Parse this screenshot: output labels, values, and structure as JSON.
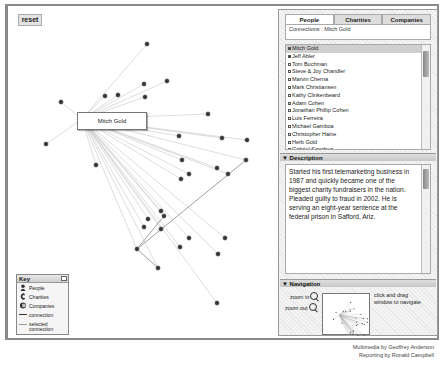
{
  "canvas": {
    "reset_label": "reset",
    "selected_node_label": "Mitch Gold",
    "center": [
      74,
      113
    ],
    "nodes": [
      [
        139,
        38
      ],
      [
        159,
        75
      ],
      [
        136,
        78
      ],
      [
        110,
        89
      ],
      [
        53,
        96
      ],
      [
        97,
        90
      ],
      [
        137,
        91
      ],
      [
        38,
        138
      ],
      [
        88,
        159
      ],
      [
        200,
        108
      ],
      [
        171,
        130
      ],
      [
        214,
        132
      ],
      [
        174,
        154
      ],
      [
        220,
        168
      ],
      [
        239,
        134
      ],
      [
        173,
        173
      ],
      [
        209,
        162
      ],
      [
        153,
        223
      ],
      [
        181,
        168
      ],
      [
        153,
        205
      ],
      [
        156,
        210
      ],
      [
        140,
        213
      ],
      [
        129,
        243
      ],
      [
        136,
        221
      ],
      [
        150,
        262
      ],
      [
        181,
        232
      ],
      [
        172,
        241
      ],
      [
        209,
        297
      ],
      [
        217,
        232
      ],
      [
        238,
        154
      ],
      [
        210,
        248
      ]
    ]
  },
  "key": {
    "title": "Key",
    "items": [
      {
        "icon": "people-icon",
        "label": "People"
      },
      {
        "icon": "charities-icon",
        "label": "Charities"
      },
      {
        "icon": "companies-icon",
        "label": "Companies"
      },
      {
        "icon": "connection-line-icon",
        "label": "connection"
      },
      {
        "icon": "selected-connection-line-icon",
        "label": "selected connection"
      }
    ]
  },
  "sidebar": {
    "tabs": [
      {
        "label": "People",
        "active": true
      },
      {
        "label": "Charities",
        "active": false
      },
      {
        "label": "Companies",
        "active": false
      }
    ],
    "connections_label": "Connections : Mitch Gold",
    "people": [
      "Mitch Gold",
      "Jeff Abler",
      "Tom Buchman",
      "Steve & Joy Chandler",
      "Marvin Cherna",
      "Mark Christiansen",
      "Kathy Clinkenbeard",
      "Adam Cohen",
      "Jonathan Phillip Cohen",
      "Luis Ferreira",
      "Michael Gamboa",
      "Christopher Haine",
      "Herb Gold",
      "Gabriel Sanchez",
      "Duane Kolva"
    ],
    "description": {
      "title": "Description",
      "text": "Started his first telemarketing business in 1987 and quickly became one of the biggest charity fundraisers in the nation. Pleaded guilty to fraud in 2002. He is serving an eight-year sentence at the federal prison in Safford, Ariz."
    },
    "navigation": {
      "title": "Navigation",
      "zoom_in": "zoom in",
      "zoom_out": "zoom out",
      "hint": "click and drag window to navigate"
    }
  },
  "credits": {
    "multimedia": "Multimedia by Geoffrey Anderson",
    "reporting": "Reporting by Ronald Campbell"
  }
}
